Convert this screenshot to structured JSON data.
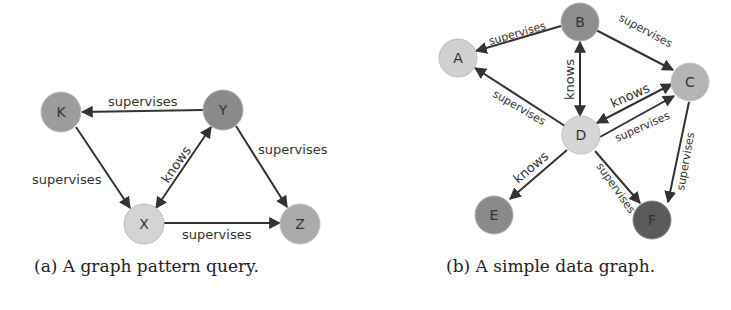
{
  "figure_a": {
    "caption": "(a) A graph pattern query.",
    "nodes": [
      {
        "id": "K",
        "label": "K",
        "color": "#9c9c9c"
      },
      {
        "id": "Y",
        "label": "Y",
        "color": "#8a8a8a"
      },
      {
        "id": "X",
        "label": "X",
        "color": "#d4d4d4"
      },
      {
        "id": "Z",
        "label": "Z",
        "color": "#ababab"
      }
    ],
    "edges": [
      {
        "from": "Y",
        "to": "K",
        "label": "supervises"
      },
      {
        "from": "K",
        "to": "X",
        "label": "supervises"
      },
      {
        "from": "X",
        "to": "Y",
        "label": "knows",
        "bidirectional": true
      },
      {
        "from": "Y",
        "to": "Z",
        "label": "supervises"
      },
      {
        "from": "X",
        "to": "Z",
        "label": "supervises"
      }
    ]
  },
  "figure_b": {
    "caption": "(b) A simple data graph.",
    "nodes": [
      {
        "id": "A",
        "label": "A",
        "color": "#d0d0d0"
      },
      {
        "id": "B",
        "label": "B",
        "color": "#8e8e8e"
      },
      {
        "id": "C",
        "label": "C",
        "color": "#b4b4b4"
      },
      {
        "id": "D",
        "label": "D",
        "color": "#d6d6d6"
      },
      {
        "id": "E",
        "label": "E",
        "color": "#8a8a8a"
      },
      {
        "id": "F",
        "label": "F",
        "color": "#5a5a5a"
      }
    ],
    "edges": [
      {
        "from": "B",
        "to": "A",
        "label": "supervises"
      },
      {
        "from": "B",
        "to": "C",
        "label": "supervises"
      },
      {
        "from": "B",
        "to": "D",
        "label": "knows",
        "bidirectional": true
      },
      {
        "from": "D",
        "to": "A",
        "label": "supervises"
      },
      {
        "from": "D",
        "to": "C",
        "label": "knows",
        "bidirectional": true
      },
      {
        "from": "D",
        "to": "C",
        "label": "supervises"
      },
      {
        "from": "D",
        "to": "E",
        "label": "knows"
      },
      {
        "from": "D",
        "to": "F",
        "label": "supervises"
      },
      {
        "from": "C",
        "to": "F",
        "label": "supervises"
      }
    ]
  }
}
